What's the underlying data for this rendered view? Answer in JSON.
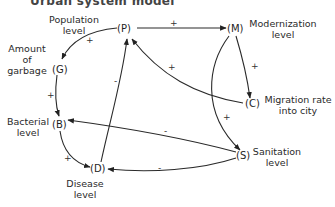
{
  "diagram": {
    "title_partial": "Urban system model",
    "nodes": [
      {
        "id": "P",
        "symbol": "(P)",
        "label": "Population level"
      },
      {
        "id": "M",
        "symbol": "(M)",
        "label": "Modernization level"
      },
      {
        "id": "G",
        "symbol": "(G)",
        "label": "Amount of garbage"
      },
      {
        "id": "C",
        "symbol": "(C)",
        "label": "Migration rate into city"
      },
      {
        "id": "B",
        "symbol": "(B)",
        "label": "Bacterial level"
      },
      {
        "id": "S",
        "symbol": "(S)",
        "label": "Sanitation level"
      },
      {
        "id": "D",
        "symbol": "(D)",
        "label": "Disease level"
      }
    ],
    "labels": {
      "P": [
        "Population",
        "level"
      ],
      "M": [
        "Modernization",
        "level"
      ],
      "G": [
        "Amount",
        "of",
        "garbage"
      ],
      "C": [
        "Migration rate",
        "into city"
      ],
      "B": [
        "Bacterial",
        "level"
      ],
      "S": [
        "Sanitation",
        "level"
      ],
      "D": [
        "Disease",
        "level"
      ]
    },
    "edges": [
      {
        "from": "P",
        "to": "M",
        "sign": "+"
      },
      {
        "from": "P",
        "to": "G",
        "sign": "+"
      },
      {
        "from": "M",
        "to": "C",
        "sign": "+"
      },
      {
        "from": "M",
        "to": "S",
        "sign": "+"
      },
      {
        "from": "C",
        "to": "P",
        "sign": "+"
      },
      {
        "from": "G",
        "to": "B",
        "sign": "+"
      },
      {
        "from": "B",
        "to": "D",
        "sign": "+"
      },
      {
        "from": "S",
        "to": "B",
        "sign": "-"
      },
      {
        "from": "S",
        "to": "D",
        "sign": "-"
      },
      {
        "from": "D",
        "to": "P",
        "sign": "-"
      }
    ],
    "signs": {
      "PM": "+",
      "PG": "+",
      "MC": "+",
      "MS": "+",
      "CP": "+",
      "GB": "+",
      "BD": "+",
      "SB": "-",
      "SD": "-",
      "DP": "-"
    }
  }
}
